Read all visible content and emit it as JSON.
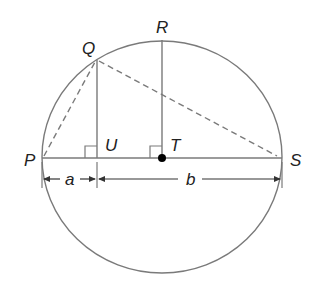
{
  "diagram": {
    "title": "",
    "colors": {
      "stroke": "#7a7a7a",
      "text": "#222222",
      "point": "#000000"
    },
    "points": {
      "P": {
        "label": "P",
        "x": 42,
        "y": 158
      },
      "Q": {
        "label": "Q",
        "x": 97,
        "y": 60
      },
      "R": {
        "label": "R",
        "x": 162,
        "y": 40
      },
      "S": {
        "label": "S",
        "x": 282,
        "y": 158
      },
      "T": {
        "label": "T",
        "x": 162,
        "y": 158
      },
      "U": {
        "label": "U",
        "x": 97,
        "y": 158
      }
    },
    "segments": {
      "a": {
        "label": "a"
      },
      "b": {
        "label": "b"
      }
    }
  }
}
